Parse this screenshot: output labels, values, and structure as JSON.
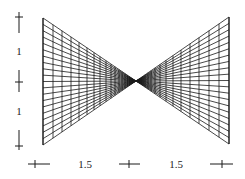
{
  "figure": {
    "width": 245,
    "height": 179,
    "stroke_color": "#1a1a1a",
    "background": "#ffffff",
    "mesh": {
      "center": [
        136,
        81
      ],
      "left_edge": {
        "x": 43,
        "top": 18,
        "bottom": 145
      },
      "right_edge": {
        "x": 229,
        "top": 17,
        "bottom": 144
      },
      "rows": 20,
      "left_columns_x": [
        43,
        53,
        62,
        71,
        79,
        87,
        94,
        100,
        106,
        111,
        115,
        119,
        122,
        125,
        127.5,
        129.5,
        131,
        132.5,
        133.5,
        134.5
      ],
      "right_columns_x": [
        229,
        219,
        209,
        199,
        190,
        181,
        173,
        166,
        160,
        155,
        151,
        148,
        145,
        143,
        141.5,
        140,
        139,
        138.2,
        137.5,
        137
      ]
    },
    "vertical_dimension": {
      "x": 19,
      "markers": [
        {
          "name": "top",
          "line_from": 12,
          "line_to": 33,
          "cross_y": 17
        },
        {
          "name": "middle",
          "line_from": 70,
          "line_to": 92,
          "cross_y": 82
        },
        {
          "name": "bottom",
          "line_from": 130,
          "line_to": 150,
          "cross_y": 146
        }
      ],
      "labels": [
        {
          "text": "1",
          "x": 19,
          "y": 51
        },
        {
          "text": "1",
          "x": 19,
          "y": 111
        }
      ]
    },
    "horizontal_dimension": {
      "y": 164,
      "markers": [
        {
          "name": "left",
          "line_from": 28,
          "line_to": 50,
          "cross_x": 35
        },
        {
          "name": "middle",
          "line_from": 119,
          "line_to": 140,
          "cross_x": 129
        },
        {
          "name": "right",
          "line_from": 210,
          "line_to": 233,
          "cross_x": 222
        }
      ],
      "labels": [
        {
          "text": "1.5",
          "x": 85,
          "y": 164
        },
        {
          "text": "1.5",
          "x": 176,
          "y": 164
        }
      ]
    }
  }
}
